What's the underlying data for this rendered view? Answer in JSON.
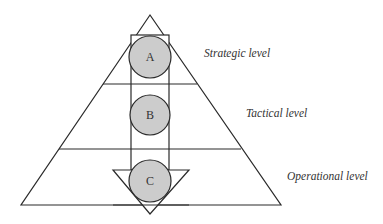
{
  "diagram": {
    "type": "pyramid",
    "colors": {
      "stroke": "#2a2a2a",
      "circle_fill": "#cccccc",
      "background": "#ffffff",
      "label_text": "#333333"
    },
    "levels": [
      {
        "label": "Strategic level"
      },
      {
        "label": "Tactical level"
      },
      {
        "label": "Operational level"
      }
    ],
    "nodes": [
      {
        "id": "A"
      },
      {
        "id": "B"
      },
      {
        "id": "C"
      }
    ],
    "arrow": {
      "direction": "down"
    }
  }
}
